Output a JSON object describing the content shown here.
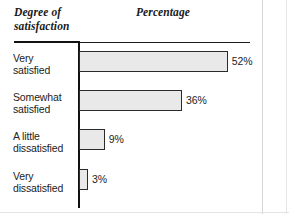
{
  "headers": {
    "category_header": "Degree of satisfaction",
    "value_header": "Percentage"
  },
  "chart_data": {
    "type": "bar",
    "orientation": "horizontal",
    "title": "",
    "xlabel": "Percentage",
    "ylabel": "Degree of satisfaction",
    "categories": [
      "Very satisfied",
      "Somewhat satisfied",
      "A little dissatisfied",
      "Very dissatisfied"
    ],
    "values": [
      52,
      36,
      9,
      3
    ],
    "value_labels": [
      "52%",
      "36%",
      "9%",
      "3%"
    ],
    "xlim": [
      0,
      52
    ],
    "grid": false,
    "legend": false,
    "bar_fill_color": "#e9e9e9",
    "bar_border_color": "#2b2b2b",
    "axis_color": "#111111"
  },
  "rows": [
    {
      "label_line1": "Very",
      "label_line2": "satisfied",
      "value": "52%",
      "pct": 52
    },
    {
      "label_line1": "Somewhat",
      "label_line2": "satisfied",
      "value": "36%",
      "pct": 36
    },
    {
      "label_line1": "A little",
      "label_line2": "dissatisfied",
      "value": "9%",
      "pct": 9
    },
    {
      "label_line1": "Very",
      "label_line2": "dissatisfied",
      "value": "3%",
      "pct": 3
    }
  ]
}
